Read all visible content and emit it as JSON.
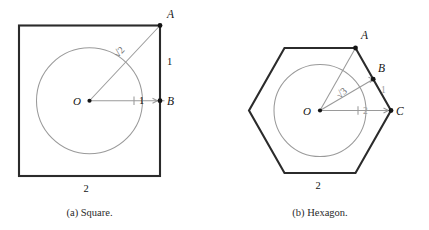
{
  "figure": {
    "panels": [
      {
        "id": "square",
        "caption": "(a) Square.",
        "shape": "square",
        "center_label": "O",
        "vertex_labels": [
          "A",
          "B"
        ],
        "measures": {
          "diagonal": "√2",
          "apothem_vertical": "1",
          "apothem_horizontal": "1",
          "side": "2"
        },
        "colors": {
          "outline": "#2b2b2b",
          "incircle": "#9a9a9a",
          "radius": "#9a9a9a",
          "text": "#141414",
          "muted_text": "#9a9a9a"
        }
      },
      {
        "id": "hexagon",
        "caption": "(b) Hexagon.",
        "shape": "hexagon",
        "center_label": "O",
        "vertex_labels": [
          "A",
          "B",
          "C"
        ],
        "measures": {
          "apothem_diagonal": "√3",
          "midpoint_radius": "1",
          "circumradius": "2",
          "side": "2"
        },
        "colors": {
          "outline": "#2b2b2b",
          "incircle": "#9a9a9a",
          "radius": "#9a9a9a",
          "text": "#141414",
          "muted_text": "#9a9a9a"
        }
      }
    ]
  }
}
